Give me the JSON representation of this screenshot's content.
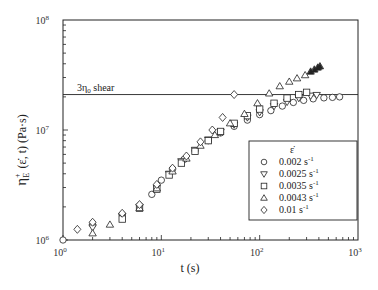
{
  "chart_data": {
    "type": "scatter",
    "title": "",
    "xlabel": "t (s)",
    "ylabel": "η_E^+ (ε̇, t) (Pa·s)",
    "xscale": "log",
    "yscale": "log",
    "xlim": [
      1,
      1000
    ],
    "ylim": [
      1000000,
      100000000
    ],
    "x_ticks": [
      {
        "v": 1,
        "label": "10",
        "exp": "0"
      },
      {
        "v": 10,
        "label": "10",
        "exp": "1"
      },
      {
        "v": 100,
        "label": "10",
        "exp": "2"
      },
      {
        "v": 1000,
        "label": "10",
        "exp": "3"
      }
    ],
    "y_ticks": [
      {
        "v": 1000000,
        "label": "10",
        "exp": "6"
      },
      {
        "v": 10000000,
        "label": "10",
        "exp": "7"
      },
      {
        "v": 100000000,
        "label": "10",
        "exp": "8"
      }
    ],
    "grid": false,
    "legend_title": "ε̇",
    "legend_position": "inside lower right",
    "annotations": [
      {
        "text": "3η",
        "sub": "0",
        "suffix": " shear",
        "type": "hline",
        "y": 21000000
      }
    ],
    "series": [
      {
        "name": "0.002 s-1",
        "label": "0.002 s",
        "sup": "-1",
        "marker": "circle",
        "points": [
          [
            1,
            1000000
          ],
          [
            2,
            1380000
          ],
          [
            4,
            1700000
          ],
          [
            6,
            2050000
          ],
          [
            8,
            2600000
          ],
          [
            10,
            3500000
          ],
          [
            13,
            4400000
          ],
          [
            17,
            5400000
          ],
          [
            22,
            6500000
          ],
          [
            30,
            8000000
          ],
          [
            40,
            9400000
          ],
          [
            55,
            10800000
          ],
          [
            75,
            12300000
          ],
          [
            100,
            13800000
          ],
          [
            130,
            15000000
          ],
          [
            170,
            16500000
          ],
          [
            220,
            17800000
          ],
          [
            280,
            18600000
          ],
          [
            350,
            19200000
          ],
          [
            450,
            19600000
          ],
          [
            550,
            19800000
          ],
          [
            650,
            20000000
          ]
        ]
      },
      {
        "name": "0.0025 s-1",
        "label": "0.0025 s",
        "sup": "-1",
        "marker": "triangle-down",
        "points": [
          [
            2,
            1300000
          ],
          [
            4,
            1650000
          ],
          [
            6,
            2000000
          ],
          [
            9,
            3000000
          ],
          [
            12,
            4000000
          ],
          [
            16,
            5200000
          ],
          [
            22,
            6600000
          ],
          [
            30,
            8200000
          ],
          [
            40,
            9600000
          ],
          [
            55,
            11200000
          ],
          [
            75,
            13000000
          ],
          [
            100,
            14500000
          ],
          [
            140,
            16500000
          ],
          [
            190,
            18000000
          ],
          [
            250,
            19500000
          ],
          [
            330,
            20500000
          ],
          [
            380,
            20800000
          ]
        ]
      },
      {
        "name": "0.0035 s-1",
        "label": "0.0035 s",
        "sup": "-1",
        "marker": "square",
        "points": [
          [
            4,
            1550000
          ],
          [
            6,
            1950000
          ],
          [
            9,
            2900000
          ],
          [
            12,
            3900000
          ],
          [
            16,
            5000000
          ],
          [
            22,
            6400000
          ],
          [
            30,
            8000000
          ],
          [
            40,
            9700000
          ],
          [
            55,
            11500000
          ],
          [
            75,
            13500000
          ],
          [
            100,
            15500000
          ],
          [
            140,
            17500000
          ],
          [
            190,
            19500000
          ],
          [
            250,
            21000000
          ],
          [
            300,
            22000000
          ]
        ]
      },
      {
        "name": "0.0043 s-1",
        "label": "0.0043 s",
        "sup": "-1",
        "marker": "triangle-up",
        "points": [
          [
            2,
            1150000
          ],
          [
            3,
            1380000
          ],
          [
            6,
            1950000
          ],
          [
            9,
            2950000
          ],
          [
            13,
            4200000
          ],
          [
            18,
            5500000
          ],
          [
            25,
            7200000
          ],
          [
            35,
            9000000
          ],
          [
            50,
            11500000
          ],
          [
            70,
            14000000
          ],
          [
            95,
            17500000
          ],
          [
            125,
            21500000
          ],
          [
            160,
            25000000
          ],
          [
            200,
            27500000
          ],
          [
            240,
            29500000
          ],
          [
            290,
            31500000
          ],
          [
            330,
            34000000
          ],
          [
            360,
            35500000
          ],
          [
            390,
            37000000
          ],
          [
            410,
            38000000
          ]
        ]
      },
      {
        "name": "0.01 s-1",
        "label": "0.01 s",
        "sup": "-1",
        "marker": "diamond",
        "points": [
          [
            1.4,
            1250000
          ],
          [
            2,
            1450000
          ],
          [
            4,
            1750000
          ],
          [
            6,
            2100000
          ],
          [
            9,
            3200000
          ],
          [
            13,
            4500000
          ],
          [
            18,
            5800000
          ],
          [
            25,
            7800000
          ],
          [
            33,
            10000000
          ],
          [
            42,
            13000000
          ],
          [
            55,
            21000000
          ]
        ]
      }
    ]
  }
}
